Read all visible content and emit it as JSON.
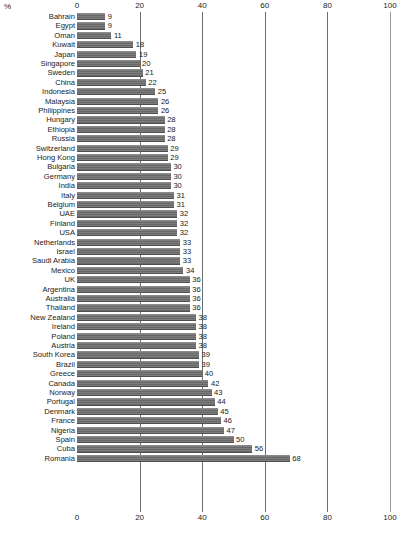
{
  "chart_data": {
    "type": "bar",
    "orientation": "horizontal",
    "title": "",
    "subtitle": "",
    "xlabel": "",
    "ylabel": "",
    "unit_label": "%",
    "xlim": [
      0,
      100
    ],
    "grid": true,
    "gridlines": [
      0,
      20,
      40,
      60,
      80,
      100
    ],
    "axis_positions": "top-and-bottom",
    "legend": null,
    "bar_color": "#6e6e6e",
    "axis_ticks": [
      "0",
      "20",
      "40",
      "60",
      "80",
      "100"
    ],
    "categories": [
      "Bahrain",
      "Egypt",
      "Oman",
      "Kuwait",
      "Japan",
      "Singapore",
      "Sweden",
      "China",
      "Indonesia",
      "Malaysia",
      "Philippines",
      "Hungary",
      "Ethiopia",
      "Russia",
      "Switzerland",
      "Hong Kong",
      "Bulgaria",
      "Germany",
      "India",
      "Italy",
      "Belgium",
      "UAE",
      "Finland",
      "USA",
      "Netherlands",
      "Israel",
      "Saudi Arabia",
      "Mexico",
      "UK",
      "Argentina",
      "Australia",
      "Thailand",
      "New Zealand",
      "Ireland",
      "Poland",
      "Austria",
      "South Korea",
      "Brazil",
      "Greece",
      "Canada",
      "Norway",
      "Portugal",
      "Denmark",
      "France",
      "Nigeria",
      "Spain",
      "Cuba",
      "Romania"
    ],
    "values": [
      9,
      9,
      11,
      18,
      19,
      20,
      21,
      22,
      25,
      26,
      26,
      28,
      28,
      28,
      29,
      29,
      30,
      30,
      30,
      31,
      31,
      32,
      32,
      32,
      33,
      33,
      33,
      34,
      36,
      36,
      36,
      36,
      38,
      38,
      38,
      38,
      39,
      39,
      40,
      42,
      43,
      44,
      45,
      46,
      47,
      50,
      56,
      68
    ],
    "data_labels": [
      "9",
      "9",
      "11",
      "18",
      "19",
      "20",
      "21",
      "22",
      "25",
      "26",
      "26",
      "28",
      "28",
      "28",
      "29",
      "29",
      "30",
      "30",
      "30",
      "31",
      "31",
      "32",
      "32",
      "32",
      "33",
      "33",
      "33",
      "34",
      "36",
      "36",
      "36",
      "36",
      "38",
      "38",
      "38",
      "38",
      "39",
      "39",
      "40",
      "42",
      "43",
      "44",
      "45",
      "46",
      "47",
      "50",
      "56",
      "68"
    ]
  }
}
